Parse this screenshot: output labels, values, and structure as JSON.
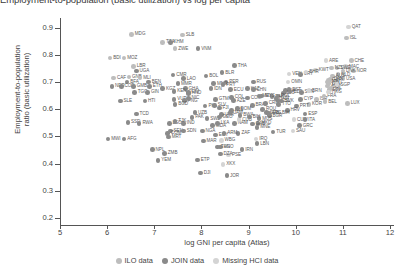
{
  "title_clipped": "Employment-to-population (basic utilization) vs log per capita",
  "axes": {
    "xlabel": "log GNI per capita (Atlas)",
    "ylabel_line1": "Employment-to-population",
    "ylabel_line2": "ratio (basic utilization)",
    "xticks": [
      "5",
      "6",
      "7",
      "8",
      "9",
      "10",
      "11",
      "12"
    ],
    "yticks": [
      "0.9",
      "0.8",
      "0.7",
      "0.6",
      "0.5",
      "0.4",
      "0.3",
      "0.2"
    ]
  },
  "legend": {
    "items": [
      {
        "label": "ILO data",
        "color": "#bdbdbd"
      },
      {
        "label": "JOIN data",
        "color": "#8a8a8a"
      },
      {
        "label": "Missing HCI data",
        "color": "#d4d4d4"
      }
    ]
  },
  "colors": {
    "ilo": "#bdbdbd",
    "join": "#8a8a8a",
    "missing": "#d4d4d4",
    "axis": "#555555",
    "text": "#3f3f3f"
  },
  "chart_data": {
    "type": "scatter",
    "title": "Employment-to-population (basic utilization) vs log per capita",
    "xlabel": "log GNI per capita (Atlas)",
    "ylabel": "Employment-to-population ratio (basic utilization)",
    "xlim": [
      5,
      12
    ],
    "ylim": [
      0.2,
      0.95
    ],
    "grid": false,
    "legend_position": "bottom",
    "series": [
      {
        "name": "ILO data",
        "color": "#bdbdbd"
      },
      {
        "name": "JOIN data",
        "color": "#8a8a8a"
      },
      {
        "name": "Missing HCI data",
        "color": "#d4d4d4"
      }
    ],
    "points": [
      {
        "code": "MDG",
        "x": 6.52,
        "y": 0.875,
        "g": "ilo"
      },
      {
        "code": "SLB",
        "x": 7.6,
        "y": 0.872,
        "g": "ilo"
      },
      {
        "code": "TZA",
        "x": 7.18,
        "y": 0.846,
        "g": "ilo"
      },
      {
        "code": "KHM",
        "x": 7.34,
        "y": 0.846,
        "g": "join"
      },
      {
        "code": "ZWE",
        "x": 7.44,
        "y": 0.822,
        "g": "ilo"
      },
      {
        "code": "VNM",
        "x": 7.93,
        "y": 0.822,
        "g": "join"
      },
      {
        "code": "QAT",
        "x": 11.12,
        "y": 0.902,
        "g": "missing"
      },
      {
        "code": "ISL",
        "x": 11.08,
        "y": 0.862,
        "g": "ilo"
      },
      {
        "code": "BDI",
        "x": 6.06,
        "y": 0.788,
        "g": "ilo"
      },
      {
        "code": "MOZ",
        "x": 6.36,
        "y": 0.788,
        "g": "ilo"
      },
      {
        "code": "LBR",
        "x": 6.56,
        "y": 0.757,
        "g": "ilo"
      },
      {
        "code": "UGA",
        "x": 6.62,
        "y": 0.74,
        "g": "join"
      },
      {
        "code": "ARE",
        "x": 10.64,
        "y": 0.778,
        "g": "missing"
      },
      {
        "code": "CHE",
        "x": 11.18,
        "y": 0.778,
        "g": "ilo"
      },
      {
        "code": "MAC",
        "x": 11.06,
        "y": 0.756,
        "g": "missing"
      },
      {
        "code": "NOR",
        "x": 11.22,
        "y": 0.74,
        "g": "ilo"
      },
      {
        "code": "SWE",
        "x": 10.88,
        "y": 0.752,
        "g": "ilo"
      },
      {
        "code": "NZL",
        "x": 10.76,
        "y": 0.752,
        "g": "ilo"
      },
      {
        "code": "DNK",
        "x": 11.0,
        "y": 0.74,
        "g": "ilo"
      },
      {
        "code": "NLD",
        "x": 10.9,
        "y": 0.727,
        "g": "ilo"
      },
      {
        "code": "USA",
        "x": 11.0,
        "y": 0.712,
        "g": "ilo"
      },
      {
        "code": "CAF",
        "x": 6.14,
        "y": 0.715,
        "g": "ilo"
      },
      {
        "code": "GNB",
        "x": 6.46,
        "y": 0.718,
        "g": "ilo"
      },
      {
        "code": "MLI",
        "x": 6.7,
        "y": 0.715,
        "g": "ilo"
      },
      {
        "code": "BFA",
        "x": 6.42,
        "y": 0.7,
        "g": "join"
      },
      {
        "code": "BEN",
        "x": 6.88,
        "y": 0.7,
        "g": "join"
      },
      {
        "code": "NER",
        "x": 6.1,
        "y": 0.684,
        "g": "join"
      },
      {
        "code": "COD",
        "x": 6.3,
        "y": 0.684,
        "g": "join"
      },
      {
        "code": "GMB",
        "x": 6.56,
        "y": 0.684,
        "g": "join"
      },
      {
        "code": "ETH",
        "x": 6.9,
        "y": 0.684,
        "g": "join"
      },
      {
        "code": "KGZ",
        "x": 7.18,
        "y": 0.676,
        "g": "join"
      },
      {
        "code": "TGO",
        "x": 6.58,
        "y": 0.662,
        "g": "join"
      },
      {
        "code": "GIN",
        "x": 6.86,
        "y": 0.662,
        "g": "join"
      },
      {
        "code": "CMR",
        "x": 7.4,
        "y": 0.726,
        "g": "join"
      },
      {
        "code": "THA",
        "x": 8.7,
        "y": 0.76,
        "g": "join"
      },
      {
        "code": "BLR",
        "x": 8.44,
        "y": 0.734,
        "g": "join"
      },
      {
        "code": "SLE",
        "x": 6.28,
        "y": 0.63,
        "g": "join"
      },
      {
        "code": "HTI",
        "x": 6.8,
        "y": 0.63,
        "g": "join"
      },
      {
        "code": "BOL",
        "x": 8.1,
        "y": 0.722,
        "g": "join"
      },
      {
        "code": "PER",
        "x": 8.52,
        "y": 0.7,
        "g": "join"
      },
      {
        "code": "RUS",
        "x": 9.1,
        "y": 0.7,
        "g": "join"
      },
      {
        "code": "MNG",
        "x": 8.26,
        "y": 0.694,
        "g": "join"
      },
      {
        "code": "IDN",
        "x": 8.2,
        "y": 0.676,
        "g": "join"
      },
      {
        "code": "ECU",
        "x": 8.62,
        "y": 0.672,
        "g": "join"
      },
      {
        "code": "KAZ",
        "x": 8.98,
        "y": 0.676,
        "g": "join"
      },
      {
        "code": "CHN",
        "x": 9.1,
        "y": 0.672,
        "g": "join"
      },
      {
        "code": "COL",
        "x": 8.64,
        "y": 0.644,
        "g": "join"
      },
      {
        "code": "COM",
        "x": 8.98,
        "y": 0.642,
        "g": "join"
      },
      {
        "code": "MEX",
        "x": 9.22,
        "y": 0.648,
        "g": "join"
      },
      {
        "code": "VEN",
        "x": 9.86,
        "y": 0.73,
        "g": "missing"
      },
      {
        "code": "URY",
        "x": 10.1,
        "y": 0.728,
        "g": "join"
      },
      {
        "code": "AUS",
        "x": 10.78,
        "y": 0.722,
        "g": "ilo"
      },
      {
        "code": "CAN",
        "x": 10.74,
        "y": 0.71,
        "g": "ilo"
      },
      {
        "code": "GBR",
        "x": 10.7,
        "y": 0.706,
        "g": "ilo"
      },
      {
        "code": "JPN",
        "x": 10.68,
        "y": 0.7,
        "g": "ilo"
      },
      {
        "code": "DEU",
        "x": 10.7,
        "y": 0.694,
        "g": "ilo"
      },
      {
        "code": "AUT",
        "x": 10.68,
        "y": 0.686,
        "g": "ilo"
      },
      {
        "code": "IRL",
        "x": 10.76,
        "y": 0.678,
        "g": "ilo"
      },
      {
        "code": "FIN",
        "x": 10.72,
        "y": 0.672,
        "g": "ilo"
      },
      {
        "code": "LVA",
        "x": 9.78,
        "y": 0.668,
        "g": "join"
      },
      {
        "code": "EST",
        "x": 9.86,
        "y": 0.672,
        "g": "join"
      },
      {
        "code": "LTU",
        "x": 9.74,
        "y": 0.66,
        "g": "join"
      },
      {
        "code": "CZE",
        "x": 9.88,
        "y": 0.664,
        "g": "join"
      },
      {
        "code": "SVN",
        "x": 10.12,
        "y": 0.662,
        "g": "join"
      },
      {
        "code": "CYP",
        "x": 10.1,
        "y": 0.636,
        "g": "join"
      },
      {
        "code": "ISR",
        "x": 10.44,
        "y": 0.636,
        "g": "ilo"
      },
      {
        "code": "LUX",
        "x": 11.1,
        "y": 0.622,
        "g": "ilo"
      },
      {
        "code": "KOR",
        "x": 10.28,
        "y": 0.618,
        "g": "ilo"
      },
      {
        "code": "PRT",
        "x": 10.02,
        "y": 0.612,
        "g": "join"
      },
      {
        "code": "TTO",
        "x": 9.64,
        "y": 0.618,
        "g": "join"
      },
      {
        "code": "HRV",
        "x": 9.82,
        "y": 0.596,
        "g": "join"
      },
      {
        "code": "ESP",
        "x": 10.2,
        "y": 0.582,
        "g": "join"
      },
      {
        "code": "BIH",
        "x": 9.64,
        "y": 0.586,
        "g": "missing"
      },
      {
        "code": "SRB",
        "x": 9.38,
        "y": 0.588,
        "g": "join"
      },
      {
        "code": "BGR",
        "x": 9.44,
        "y": 0.576,
        "g": "join"
      },
      {
        "code": "CUW",
        "x": 9.96,
        "y": 0.562,
        "g": "missing"
      },
      {
        "code": "ITA",
        "x": 10.2,
        "y": 0.562,
        "g": "join"
      },
      {
        "code": "GRC",
        "x": 10.08,
        "y": 0.54,
        "g": "join"
      },
      {
        "code": "MKD",
        "x": 9.2,
        "y": 0.548,
        "g": "join"
      },
      {
        "code": "MNE",
        "x": 9.18,
        "y": 0.534,
        "g": "join"
      },
      {
        "code": "TUR",
        "x": 9.52,
        "y": 0.516,
        "g": "join"
      },
      {
        "code": "SAU",
        "x": 9.94,
        "y": 0.52,
        "g": "missing"
      },
      {
        "code": "LBN",
        "x": 9.18,
        "y": 0.474,
        "g": "join"
      },
      {
        "code": "IRQ",
        "x": 9.16,
        "y": 0.49,
        "g": "missing"
      },
      {
        "code": "PAK",
        "x": 7.8,
        "y": 0.57,
        "g": "join"
      },
      {
        "code": "LSO",
        "x": 7.32,
        "y": 0.548,
        "g": "join"
      },
      {
        "code": "IND",
        "x": 7.62,
        "y": 0.548,
        "g": "join"
      },
      {
        "code": "MDA",
        "x": 8.24,
        "y": 0.54,
        "g": "join"
      },
      {
        "code": "NAM",
        "x": 8.7,
        "y": 0.548,
        "g": "join"
      },
      {
        "code": "GAB",
        "x": 9.08,
        "y": 0.546,
        "g": "join"
      },
      {
        "code": "SEN",
        "x": 7.34,
        "y": 0.52,
        "g": "join"
      },
      {
        "code": "SDN",
        "x": 7.62,
        "y": 0.52,
        "g": "join"
      },
      {
        "code": "NGA",
        "x": 8.02,
        "y": 0.52,
        "g": "join"
      },
      {
        "code": "ZAF",
        "x": 8.78,
        "y": 0.512,
        "g": "join"
      },
      {
        "code": "EGY",
        "x": 8.3,
        "y": 0.506,
        "g": "join"
      },
      {
        "code": "TCD",
        "x": 6.62,
        "y": 0.582,
        "g": "join"
      },
      {
        "code": "SSD",
        "x": 6.44,
        "y": 0.552,
        "g": "join"
      },
      {
        "code": "RWA",
        "x": 6.68,
        "y": 0.548,
        "g": "join"
      },
      {
        "code": "TJK",
        "x": 7.44,
        "y": 0.556,
        "g": "join"
      },
      {
        "code": "MWI",
        "x": 6.02,
        "y": 0.49,
        "g": "join"
      },
      {
        "code": "AFG",
        "x": 6.36,
        "y": 0.49,
        "g": "join"
      },
      {
        "code": "COM",
        "x": 7.28,
        "y": 0.512,
        "g": "join"
      },
      {
        "code": "MRT",
        "x": 7.3,
        "y": 0.498,
        "g": "join"
      },
      {
        "code": "NPL",
        "x": 6.96,
        "y": 0.452,
        "g": "join"
      },
      {
        "code": "ZMB",
        "x": 7.22,
        "y": 0.438,
        "g": "join"
      },
      {
        "code": "YEM",
        "x": 7.08,
        "y": 0.412,
        "g": "join"
      },
      {
        "code": "ETP",
        "x": 7.92,
        "y": 0.414,
        "g": "join"
      },
      {
        "code": "DJI",
        "x": 7.98,
        "y": 0.366,
        "g": "join"
      },
      {
        "code": "JOR",
        "x": 8.54,
        "y": 0.356,
        "g": "join"
      },
      {
        "code": "XKX",
        "x": 8.46,
        "y": 0.398,
        "g": "missing"
      },
      {
        "code": "AGO",
        "x": 8.4,
        "y": 0.462,
        "g": "join"
      },
      {
        "code": "PSE",
        "x": 8.58,
        "y": 0.432,
        "g": "missing"
      },
      {
        "code": "WBG",
        "x": 8.42,
        "y": 0.486,
        "g": "missing"
      },
      {
        "code": "VUT",
        "x": 7.42,
        "y": 0.636,
        "g": "join"
      },
      {
        "code": "HND",
        "x": 7.72,
        "y": 0.658,
        "g": "join"
      },
      {
        "code": "PNG",
        "x": 7.64,
        "y": 0.632,
        "g": "join"
      },
      {
        "code": "FJI",
        "x": 8.38,
        "y": 0.604,
        "g": "join"
      },
      {
        "code": "PHL",
        "x": 8.08,
        "y": 0.612,
        "g": "join"
      },
      {
        "code": "MMR",
        "x": 7.5,
        "y": 0.694,
        "g": "join"
      },
      {
        "code": "LAO",
        "x": 7.62,
        "y": 0.712,
        "g": "join"
      },
      {
        "code": "NIC",
        "x": 7.72,
        "y": 0.64,
        "g": "join"
      },
      {
        "code": "GHA",
        "x": 7.66,
        "y": 0.676,
        "g": "join"
      },
      {
        "code": "CIV",
        "x": 7.72,
        "y": 0.662,
        "g": "join"
      },
      {
        "code": "KEN",
        "x": 7.42,
        "y": 0.666,
        "g": "join"
      },
      {
        "code": "BGD",
        "x": 7.44,
        "y": 0.618,
        "g": "join"
      },
      {
        "code": "UZB",
        "x": 7.86,
        "y": 0.588,
        "g": "join"
      },
      {
        "code": "SWZ",
        "x": 8.12,
        "y": 0.566,
        "g": "join"
      },
      {
        "code": "MAR",
        "x": 8.04,
        "y": 0.484,
        "g": "join"
      },
      {
        "code": "DZA",
        "x": 8.4,
        "y": 0.436,
        "g": "join"
      },
      {
        "code": "TUN",
        "x": 8.34,
        "y": 0.462,
        "g": "join"
      },
      {
        "code": "IRN",
        "x": 8.86,
        "y": 0.452,
        "g": "join"
      },
      {
        "code": "BRA",
        "x": 9.08,
        "y": 0.614,
        "g": "join"
      },
      {
        "code": "ARG",
        "x": 9.42,
        "y": 0.586,
        "g": "join"
      },
      {
        "code": "CHL",
        "x": 9.62,
        "y": 0.632,
        "g": "join"
      },
      {
        "code": "PAN",
        "x": 9.5,
        "y": 0.646,
        "g": "join"
      },
      {
        "code": "CRI",
        "x": 9.36,
        "y": 0.622,
        "g": "join"
      },
      {
        "code": "MYS",
        "x": 9.28,
        "y": 0.648,
        "g": "join"
      },
      {
        "code": "ROU",
        "x": 9.3,
        "y": 0.6,
        "g": "join"
      },
      {
        "code": "POL",
        "x": 9.62,
        "y": 0.648,
        "g": "join"
      },
      {
        "code": "HUN",
        "x": 9.58,
        "y": 0.64,
        "g": "join"
      },
      {
        "code": "SVK",
        "x": 9.7,
        "y": 0.63,
        "g": "join"
      },
      {
        "code": "FRA",
        "x": 10.6,
        "y": 0.648,
        "g": "ilo"
      },
      {
        "code": "BEL",
        "x": 10.62,
        "y": 0.628,
        "g": "ilo"
      },
      {
        "code": "SGP",
        "x": 10.88,
        "y": 0.69,
        "g": "missing"
      },
      {
        "code": "HKG",
        "x": 10.7,
        "y": 0.664,
        "g": "missing"
      },
      {
        "code": "KWT",
        "x": 10.42,
        "y": 0.744,
        "g": "missing"
      },
      {
        "code": "BRN",
        "x": 10.28,
        "y": 0.668,
        "g": "missing"
      },
      {
        "code": "OMN",
        "x": 9.84,
        "y": 0.7,
        "g": "missing"
      },
      {
        "code": "BHR",
        "x": 10.22,
        "y": 0.736,
        "g": "missing"
      },
      {
        "code": "ALB",
        "x": 8.64,
        "y": 0.596,
        "g": "join"
      },
      {
        "code": "UKR",
        "x": 8.42,
        "y": 0.58,
        "g": "join"
      },
      {
        "code": "GEO",
        "x": 8.38,
        "y": 0.572,
        "g": "join"
      },
      {
        "code": "ARM",
        "x": 8.48,
        "y": 0.512,
        "g": "join"
      },
      {
        "code": "AZE",
        "x": 8.68,
        "y": 0.632,
        "g": "join"
      },
      {
        "code": "LKA",
        "x": 8.34,
        "y": 0.548,
        "g": "join"
      },
      {
        "code": "PRY",
        "x": 8.46,
        "y": 0.69,
        "g": "join"
      },
      {
        "code": "GTM",
        "x": 8.3,
        "y": 0.636,
        "g": "join"
      },
      {
        "code": "SLV",
        "x": 8.28,
        "y": 0.614,
        "g": "join"
      },
      {
        "code": "DOM",
        "x": 8.76,
        "y": 0.602,
        "g": "join"
      },
      {
        "code": "JAM",
        "x": 8.62,
        "y": 0.588,
        "g": "join"
      },
      {
        "code": "CUB",
        "x": 8.8,
        "y": 0.562,
        "g": "missing"
      },
      {
        "code": "BWA",
        "x": 8.82,
        "y": 0.578,
        "g": "join"
      },
      {
        "code": "MUS",
        "x": 9.22,
        "y": 0.566,
        "g": "join"
      },
      {
        "code": "BIH2",
        "x": 9.02,
        "y": 0.572,
        "g": "join"
      }
    ]
  }
}
